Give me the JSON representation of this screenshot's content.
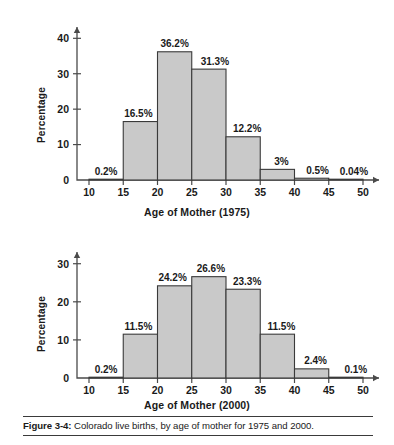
{
  "figure": {
    "caption_label": "Figure 3-4:",
    "caption_text": " Colorado live births, by age of mother for 1975 and 2000.",
    "bar_fill_color": "#c9c9c9",
    "bar_stroke_color": "#3a3a3a",
    "axis_color": "#4a4a4a"
  },
  "chart_data": [
    {
      "id": "chart-1975",
      "type": "bar",
      "title": "",
      "xlabel": "Age of Mother (1975)",
      "ylabel": "Percentage",
      "xlim": [
        10,
        50
      ],
      "ylim": [
        0,
        44
      ],
      "xticks": [
        10,
        15,
        20,
        25,
        30,
        35,
        40,
        45,
        50
      ],
      "xtick_labels": [
        "10",
        "15",
        "20",
        "25",
        "30",
        "35",
        "40",
        "45",
        "50"
      ],
      "yticks": [
        0,
        10,
        20,
        30,
        40
      ],
      "ytick_labels": [
        "0",
        "10",
        "20",
        "30",
        "40"
      ],
      "grid": false,
      "legend": "none",
      "bin_edges": [
        10,
        15,
        20,
        25,
        30,
        35,
        40,
        45,
        50
      ],
      "categories": [
        "10-15",
        "15-20",
        "20-25",
        "25-30",
        "30-35",
        "35-40",
        "40-45",
        "45-50"
      ],
      "values": [
        0.2,
        16.5,
        36.2,
        31.3,
        12.2,
        3,
        0.5,
        0.04
      ],
      "data_labels": [
        "0.2%",
        "16.5%",
        "36.2%",
        "31.3%",
        "12.2%",
        "3%",
        "0.5%",
        "0.04%"
      ]
    },
    {
      "id": "chart-2000",
      "type": "bar",
      "title": "",
      "xlabel": "Age of Mother (2000)",
      "ylabel": "Percentage",
      "xlim": [
        10,
        50
      ],
      "ylim": [
        0,
        33
      ],
      "xticks": [
        10,
        15,
        20,
        25,
        30,
        35,
        40,
        45,
        50
      ],
      "xtick_labels": [
        "10",
        "15",
        "20",
        "25",
        "30",
        "35",
        "40",
        "45",
        "50"
      ],
      "yticks": [
        0,
        10,
        20,
        30
      ],
      "ytick_labels": [
        "0",
        "10",
        "20",
        "30"
      ],
      "grid": false,
      "legend": "none",
      "bin_edges": [
        10,
        15,
        20,
        25,
        30,
        35,
        40,
        45,
        50
      ],
      "categories": [
        "10-15",
        "15-20",
        "20-25",
        "25-30",
        "30-35",
        "35-40",
        "40-45",
        "45-50"
      ],
      "values": [
        0.2,
        11.5,
        24.2,
        26.6,
        23.3,
        11.5,
        2.4,
        0.1
      ],
      "data_labels": [
        "0.2%",
        "11.5%",
        "24.2%",
        "26.6%",
        "23.3%",
        "11.5%",
        "2.4%",
        "0.1%"
      ]
    }
  ]
}
